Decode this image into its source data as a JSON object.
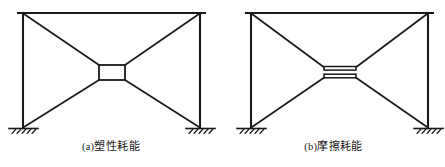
{
  "figure": {
    "background_color": "#ffffff",
    "line_color": "#1a1a1a",
    "panels": [
      {
        "id": "a",
        "tag": "(a)",
        "caption": "塑性耗能",
        "caption_meaning": "plastic energy dissipation",
        "damper_type": "rectangular-yielding-box",
        "frame": {
          "beam_left_x": 18,
          "beam_right_x": 205,
          "beam_y": 13,
          "column_left_x": 23,
          "column_right_x": 200,
          "base_y": 128
        },
        "damper": {
          "center_x": 112,
          "center_y": 72,
          "width": 26,
          "height": 15
        },
        "supports": [
          {
            "x": 23,
            "y": 128,
            "type": "fixed-hatched"
          },
          {
            "x": 200,
            "y": 128,
            "type": "fixed-hatched"
          }
        ],
        "braces": [
          {
            "from": "top-left",
            "to": "damper-top-left"
          },
          {
            "from": "top-right",
            "to": "damper-top-right"
          },
          {
            "from": "base-left",
            "to": "damper-bottom-left"
          },
          {
            "from": "base-right",
            "to": "damper-bottom-right"
          }
        ]
      },
      {
        "id": "b",
        "tag": "(b)",
        "caption": "摩擦耗能",
        "caption_meaning": "friction energy dissipation",
        "damper_type": "horizontal-friction-plates",
        "frame": {
          "beam_left_x": 24,
          "beam_right_x": 211,
          "beam_y": 13,
          "column_left_x": 29,
          "column_right_x": 206,
          "base_y": 128
        },
        "damper": {
          "center_x": 118,
          "center_y": 72,
          "plate_width": 30,
          "plate_thickness": 4,
          "plate_gap": 4
        },
        "supports": [
          {
            "x": 29,
            "y": 128,
            "type": "fixed-hatched"
          },
          {
            "x": 206,
            "y": 128,
            "type": "fixed-hatched"
          }
        ],
        "braces": [
          {
            "from": "top-left",
            "to": "upper-plate-left"
          },
          {
            "from": "top-right",
            "to": "upper-plate-right"
          },
          {
            "from": "base-left",
            "to": "lower-plate-left"
          },
          {
            "from": "base-right",
            "to": "lower-plate-right"
          }
        ]
      }
    ]
  }
}
